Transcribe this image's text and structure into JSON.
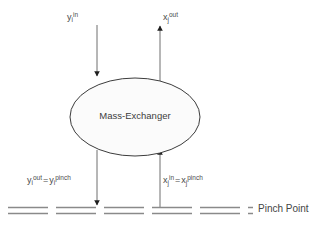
{
  "diagram": {
    "unit": {
      "name": "Mass-Exchanger",
      "shape": "ellipse",
      "fill_color": "#fbfbfb",
      "stroke_color": "#3c3c3c"
    },
    "colors": {
      "line": "#6e6e6e",
      "arrow": "#1f1f1f",
      "text": "#4a4a4a",
      "pinch_line": "#8a8a8a",
      "background": "#ffffff"
    },
    "streams": [
      {
        "id": "rich-stream-in",
        "label_parts": {
          "base": "y",
          "sub": "i",
          "sup": "in"
        },
        "label_text": "y i^in",
        "direction": "down",
        "position": "top-left"
      },
      {
        "id": "lean-stream-out",
        "label_parts": {
          "base": "x",
          "sub": "j",
          "sup": "out"
        },
        "label_text": "x j^out",
        "direction": "up",
        "position": "top-right"
      },
      {
        "id": "rich-stream-out",
        "label_parts": {
          "left": {
            "base": "y",
            "sub": "i",
            "sup": "out"
          },
          "operator": "=",
          "right": {
            "base": "y",
            "sub": "i",
            "sup": "pinch"
          }
        },
        "label_text": "y i^out = y i^pinch",
        "direction": "down",
        "position": "bottom-left"
      },
      {
        "id": "lean-stream-in",
        "label_parts": {
          "left": {
            "base": "x",
            "sub": "j",
            "sup": "in"
          },
          "operator": "=",
          "right": {
            "base": "x",
            "sub": "j",
            "sup": "pinch"
          }
        },
        "label_text": "x j^in = x j^pinch",
        "direction": "up",
        "position": "bottom-right"
      }
    ],
    "pinch": {
      "label": "Pinch Point",
      "line_style": "dashed",
      "line_count": 2,
      "dash_length": 40,
      "dash_gap": 8
    }
  }
}
